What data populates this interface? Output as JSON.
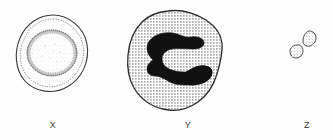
{
  "figure": {
    "type": "line-drawing",
    "title": "",
    "background_color": "#fefefe",
    "ink_color": "#2b2b2b",
    "nucleus_fill_color": "#111111",
    "cytoplasm_stipple_color": "#4a4a4a",
    "width": 333,
    "height": 140,
    "specimens": [
      {
        "id": "x",
        "label": "X",
        "description": "round cell with outer rim and large stippled central nucleus",
        "outline_shape": "circle",
        "center_x": 53,
        "center_y": 52,
        "radius": 36,
        "nucleus_radius": 24,
        "fill_style": "stippled",
        "nucleus_style": "light-stipple-with-dense-ring"
      },
      {
        "id": "y",
        "label": "Y",
        "description": "large irregular polygonal cell with dotted cytoplasm and solid dark C-shaped lobed nucleus",
        "outline_shape": "irregular-polygon",
        "center_x": 175,
        "center_y": 60,
        "fill_style": "dotted-halftone",
        "nucleus_style": "solid-black-horseshoe"
      },
      {
        "id": "z",
        "label": "Z",
        "description": "two small irregular stippled fragments",
        "outline_shape": "two-small-irregular-blobs",
        "fragment_count": 2,
        "fill_style": "stippled",
        "fragments": [
          {
            "center_x": 310,
            "center_y": 38,
            "width": 11,
            "height": 15
          },
          {
            "center_x": 297,
            "center_y": 51,
            "width": 12,
            "height": 12
          }
        ]
      }
    ],
    "labels": [
      {
        "key": "x",
        "text": "X",
        "x": 53,
        "y": 125
      },
      {
        "key": "y",
        "text": "Y",
        "x": 188,
        "y": 125
      },
      {
        "key": "z",
        "text": "Z",
        "x": 307,
        "y": 125
      }
    ]
  }
}
